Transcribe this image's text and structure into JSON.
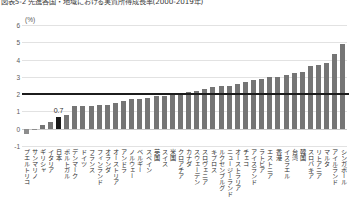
{
  "header": {
    "title": "図表5-2 先進各国・地域における実質所得成長率(2000-2019年)",
    "unit_label": "(%)"
  },
  "chart_data": {
    "type": "bar",
    "title": "図表5-2 先進各国・地域における実質所得成長率(2000-2019年)",
    "xlabel": "",
    "ylabel": "(%)",
    "ylim": [
      -1,
      6
    ],
    "yticks": [
      -1,
      0,
      1,
      2,
      3,
      4,
      5,
      6
    ],
    "grid": true,
    "legend": "none",
    "highlight_category": "日本",
    "highlight_color": "#1a1a1a",
    "bar_color": "#757575",
    "reference_line": {
      "value": 2.0,
      "color": "#1c1c1c"
    },
    "data_labels": {
      "日本": "0.7"
    },
    "categories": [
      "プエルトリコ",
      "サンマリノ",
      "ギリシャ",
      "イタリア",
      "日本",
      "ポルトガル",
      "デンマーク",
      "ドイツ",
      "フランス",
      "フィンランド",
      "オランダ",
      "オーストリア",
      "アンドラ",
      "ノルウェー",
      "ベルギー",
      "スペイン",
      "英国",
      "スイス",
      "米国",
      "クロアチア",
      "カナダ",
      "スウェーデン",
      "スロヴェニア",
      "キプロス",
      "ルクセンブルグ",
      "ニュージーランド",
      "オーストラリア",
      "チェコ",
      "アイスランド",
      "ラトビア",
      "エストニア",
      "香港",
      "イスラエル",
      "台湾",
      "韓国",
      "スロバキア",
      "リトアニア",
      "マルタ",
      "アイルランド",
      "シンガポール"
    ],
    "values": [
      -0.3,
      -0.1,
      0.2,
      0.4,
      0.7,
      0.8,
      1.3,
      1.3,
      1.3,
      1.4,
      1.4,
      1.5,
      1.6,
      1.7,
      1.7,
      1.8,
      1.9,
      1.9,
      2.0,
      2.0,
      2.1,
      2.2,
      2.3,
      2.4,
      2.5,
      2.5,
      2.6,
      2.7,
      2.8,
      2.9,
      3.0,
      3.0,
      3.1,
      3.2,
      3.3,
      3.6,
      3.7,
      3.8,
      4.3,
      4.9
    ]
  }
}
